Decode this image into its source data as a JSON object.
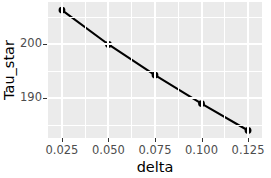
{
  "chart_data": {
    "type": "line",
    "title": "",
    "subtitle": "",
    "xlabel": "delta",
    "ylabel": "Tau_star",
    "x": [
      0.025,
      0.05,
      0.075,
      0.1,
      0.125
    ],
    "values": [
      206.4,
      200.0,
      194.3,
      189.0,
      184.0
    ],
    "series": [
      {
        "name": "Tau_star",
        "x": [
          0.025,
          0.05,
          0.075,
          0.1,
          0.125
        ],
        "values": [
          206.4,
          200.0,
          194.3,
          189.0,
          184.0
        ]
      }
    ],
    "xlim": [
      0.0175,
      0.1325
    ],
    "ylim": [
      182.6,
      207.9
    ],
    "x_tick_labels": [
      "0.025",
      "0.050",
      "0.075",
      "0.100",
      "0.125"
    ],
    "x_tick_values": [
      0.025,
      0.05,
      0.075,
      0.1,
      0.125
    ],
    "y_tick_labels": [
      "200",
      "190"
    ],
    "y_tick_values": [
      200,
      190
    ],
    "x_minor_ticks": [
      0.0375,
      0.0625,
      0.0875,
      0.1125
    ],
    "y_minor_ticks": [
      205,
      195,
      185
    ],
    "grid": true,
    "legend": "none",
    "marker": "filled-circle",
    "line_color": "#000000",
    "point_color": "#000000",
    "panel_background": "#ebebeb",
    "grid_color": "#ffffff",
    "axis_text_color": "#4d4d4d",
    "axis_title_color": "#000000"
  }
}
